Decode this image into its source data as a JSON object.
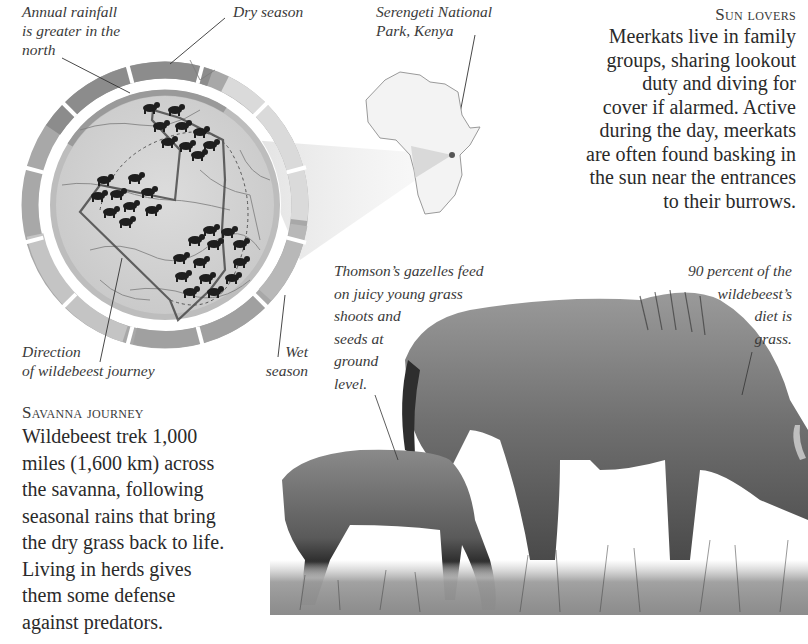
{
  "map_section": {
    "labels": {
      "annual_rainfall": [
        "Annual rainfall",
        "is greater in the",
        "north"
      ],
      "dry_season": "Dry season",
      "direction": [
        "Direction",
        "of wildebeest journey"
      ],
      "wet_season": [
        "Wet",
        "season"
      ]
    },
    "locator": {
      "label": [
        "Serengeti National",
        "Park, Kenya"
      ]
    },
    "colors": {
      "dry_ring": "#8f8f8f",
      "wet_ring": "#c9c9c9",
      "map_fill": "#d6d6d6",
      "route": "#555555",
      "herd": "#1e1e1e"
    }
  },
  "sun_lovers": {
    "heading": "Sun lovers",
    "lines": [
      "Meerkats live in family",
      "groups, sharing lookout",
      "duty and diving for",
      "cover if alarmed. Active",
      "during the day, meerkats",
      "are often found basking in",
      "the sun near the entrances",
      "to their burrows."
    ]
  },
  "savanna_journey": {
    "heading": "Savanna journey",
    "lines": [
      "Wildebeest trek 1,000",
      "miles (1,600 km) across",
      "the savanna, following",
      "seasonal rains that bring",
      "the dry grass back to life.",
      "Living in herds gives",
      "them some defense",
      "against predators."
    ]
  },
  "illustration": {
    "gazelle_caption": [
      "Thomson’s gazelles feed",
      "on juicy young grass",
      "shoots and",
      "seeds at",
      "ground",
      "level."
    ],
    "wildebeest_caption": [
      "90 percent of the",
      "wildebeest’s",
      "diet is",
      "grass."
    ]
  }
}
